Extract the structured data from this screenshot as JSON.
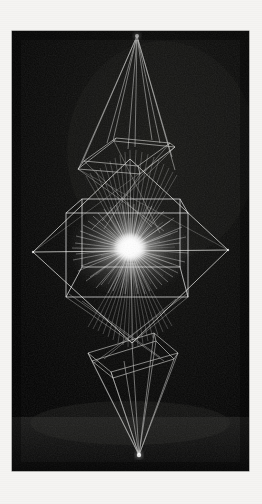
{
  "image": {
    "kind": "light-painting-photograph",
    "title": "Light Drawing",
    "subject": "Geometric wireframe light sculpture",
    "orientation": "portrait",
    "caption": "",
    "margin_color": "#f5f4f2",
    "photo": {
      "x": 12,
      "y": 31,
      "width": 237,
      "height": 440,
      "background_color": "#050505",
      "stroke_color": "#e8e8e6",
      "glow_color": "#ffffff",
      "floor_tone": "#141414",
      "backdrop_tone": "#0d0d0d"
    },
    "structure": {
      "top_apex": {
        "x": 125,
        "y": 5,
        "label": "upper convergence point"
      },
      "bottom_apex": {
        "x": 127,
        "y": 424,
        "label": "lower convergence point"
      },
      "left_vertex": {
        "x": 21,
        "y": 221,
        "label": "left diamond vertex"
      },
      "right_vertex": {
        "x": 216,
        "y": 219,
        "label": "right diamond vertex"
      },
      "center": {
        "x": 118,
        "y": 219,
        "label": "radial light burst"
      },
      "cube": {
        "front_face": {
          "x": 54,
          "y": 182,
          "width": 122,
          "height": 84
        },
        "back_face": {
          "x": 70,
          "y": 170,
          "width": 98,
          "height": 70
        }
      },
      "upper_frame": {
        "top": 108,
        "bottom": 140,
        "label": "upper trapezoid wireframe"
      },
      "lower_frame": {
        "top": 300,
        "bottom": 336,
        "label": "lower trapezoid wireframe"
      },
      "burst_rays": 96,
      "burst_radius": 62
    }
  }
}
